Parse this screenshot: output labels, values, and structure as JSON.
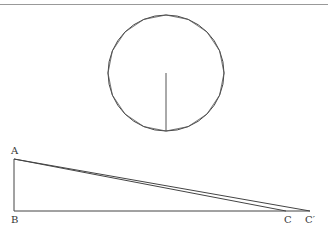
{
  "diagram": {
    "labels": {
      "A": "A",
      "B": "B",
      "C": "C",
      "Cprime": "C′"
    },
    "circle": {
      "cx": 166,
      "cy": 73,
      "r": 58,
      "polygon_sides": 16
    },
    "colors": {
      "stroke": "#333333",
      "rule": "#888888"
    }
  }
}
